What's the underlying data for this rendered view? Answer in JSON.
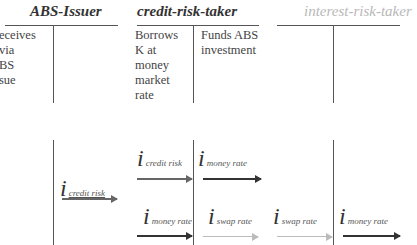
{
  "accounts": [
    {
      "title": "ABS-Issuer",
      "debit": [
        "eceives",
        " via",
        "BS",
        "sue"
      ],
      "credit": []
    },
    {
      "title": "credit-risk-taker",
      "debit": [
        "Borrows",
        "K at",
        "money",
        "market",
        "rate"
      ],
      "credit": [
        "Funds ABS",
        "investment"
      ]
    },
    {
      "title": "interest-risk-taker",
      "debit": [],
      "credit": []
    }
  ],
  "flows": [
    {
      "symbol": "i",
      "subscript": "credit risk",
      "style": "mid"
    },
    {
      "symbol": "i",
      "subscript": "credit risk",
      "style": "mid"
    },
    {
      "symbol": "i",
      "subscript": "money rate",
      "style": "dark"
    },
    {
      "symbol": "i",
      "subscript": "money rate",
      "style": "dark"
    },
    {
      "symbol": "i",
      "subscript": "swap rate",
      "style": "light"
    },
    {
      "symbol": "i",
      "subscript": "swap rate",
      "style": "light"
    },
    {
      "symbol": "i",
      "subscript": "money rate",
      "style": "dark"
    }
  ]
}
